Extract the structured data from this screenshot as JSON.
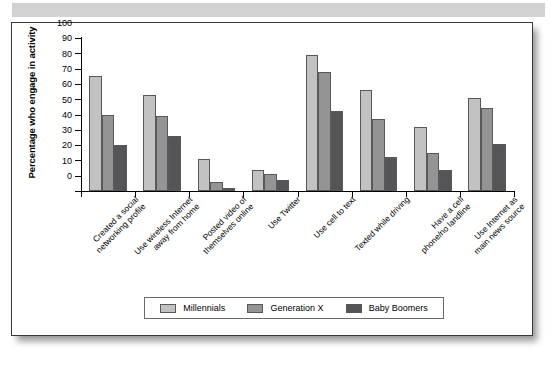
{
  "page": {
    "band_color": "#d2d2d2",
    "frame_border_color": "#3a3a3a"
  },
  "chart_data": {
    "type": "bar",
    "title": "",
    "xlabel": "",
    "ylabel": "Percentage who engage in activity",
    "ylim": [
      0,
      100
    ],
    "ytick_step": 10,
    "yticks": [
      0,
      10,
      20,
      30,
      40,
      50,
      60,
      70,
      80,
      90,
      100
    ],
    "grid": false,
    "legend_position": "bottom",
    "categories": [
      "Created a social\nnetworking profile",
      "Use wireless Internet\naway from home",
      "Posted video of\nthemselves online",
      "Use Twitter",
      "Use cell to text",
      "Texted while driving",
      "Have a cell\nphone/no landline",
      "Use Internet as\nmain news source"
    ],
    "series": [
      {
        "name": "Millennials",
        "color": "#c2c2c2",
        "values": [
          75,
          63,
          21,
          14,
          89,
          66,
          42,
          61
        ]
      },
      {
        "name": "Generation X",
        "color": "#949494",
        "values": [
          50,
          49,
          6,
          11,
          78,
          47,
          25,
          54
        ]
      },
      {
        "name": "Baby Boomers",
        "color": "#555557",
        "values": [
          30,
          36,
          2,
          7,
          52,
          22,
          14,
          31
        ]
      }
    ]
  }
}
